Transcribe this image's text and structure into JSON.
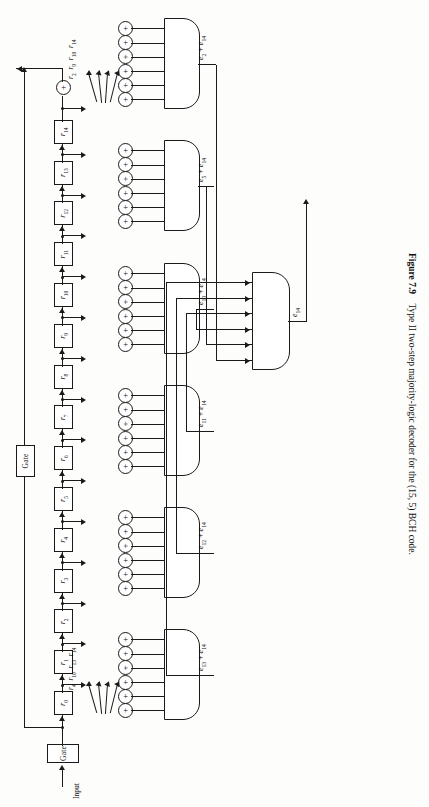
{
  "figure": {
    "number": "Figure 7.9",
    "caption": "Type II two-step majority-logic decoder for the (15, 5) BCH code.",
    "full_caption": "Figure 7.9   Type II two-step majority-logic decoder for the (15, 5) BCH code."
  },
  "input": {
    "label": "Input"
  },
  "gates": {
    "input_gate_label": "Gate",
    "feedback_gate_label": "Gate"
  },
  "shift_register": {
    "stage_labels": [
      "r0",
      "r1",
      "r2",
      "r3",
      "r4",
      "r5",
      "r6",
      "r7",
      "r8",
      "r9",
      "r10",
      "r11",
      "r12",
      "r13",
      "r14"
    ],
    "stage_display": [
      {
        "base": "r",
        "sub": "0"
      },
      {
        "base": "r",
        "sub": "1"
      },
      {
        "base": "r",
        "sub": "2"
      },
      {
        "base": "r",
        "sub": "3"
      },
      {
        "base": "r",
        "sub": "4"
      },
      {
        "base": "r",
        "sub": "5"
      },
      {
        "base": "r",
        "sub": "6"
      },
      {
        "base": "r",
        "sub": "7"
      },
      {
        "base": "r",
        "sub": "8"
      },
      {
        "base": "r",
        "sub": "9"
      },
      {
        "base": "r",
        "sub": "10"
      },
      {
        "base": "r",
        "sub": "11"
      },
      {
        "base": "r",
        "sub": "12"
      },
      {
        "base": "r",
        "sub": "13"
      },
      {
        "base": "r",
        "sub": "14"
      }
    ],
    "stage_count": 15
  },
  "adder_symbol": "+",
  "majority_gates": [
    {
      "id": "mg-e2",
      "output_label": "e2 + e14",
      "output_parts": {
        "first_base": "e",
        "first_sub": "2",
        "second_base": "e",
        "second_sub": "14"
      },
      "adder_count": 6,
      "feed_labels": [
        "r2",
        "r9",
        "r10",
        "r14"
      ]
    },
    {
      "id": "mg-e5",
      "output_label": "e5 + e14",
      "output_parts": {
        "first_base": "e",
        "first_sub": "5",
        "second_base": "e",
        "second_sub": "14"
      },
      "adder_count": 6,
      "feed_labels": []
    },
    {
      "id": "mg-e10",
      "output_label": "e10 + e14",
      "output_parts": {
        "first_base": "e",
        "first_sub": "10",
        "second_base": "e",
        "second_sub": "14"
      },
      "adder_count": 6,
      "feed_labels": []
    },
    {
      "id": "mg-e11",
      "output_label": "e11 + e14",
      "output_parts": {
        "first_base": "e",
        "first_sub": "11",
        "second_base": "e",
        "second_sub": "14"
      },
      "adder_count": 6,
      "feed_labels": []
    },
    {
      "id": "mg-e12",
      "output_label": "e12 + e14",
      "output_parts": {
        "first_base": "e",
        "first_sub": "12",
        "second_base": "e",
        "second_sub": "14"
      },
      "adder_count": 6,
      "feed_labels": []
    },
    {
      "id": "mg-e13",
      "output_label": "e13 + e14",
      "output_parts": {
        "first_base": "e",
        "first_sub": "13",
        "second_base": "e",
        "second_sub": "14"
      },
      "adder_count": 6,
      "feed_labels": [
        "r4",
        "r10",
        "r13",
        "r14"
      ]
    }
  ],
  "final_gate": {
    "id": "mg-final",
    "output_label": "e14",
    "output_parts": {
      "base": "e",
      "sub": "14"
    },
    "input_count": 6
  },
  "feed_groups": {
    "bottom": {
      "labels": [
        "r2",
        "r9",
        "r10",
        "r14"
      ],
      "display": "r2 r9 r10 r14"
    },
    "top": {
      "labels": [
        "r4",
        "r10",
        "r13",
        "r14"
      ],
      "display": "r4 r10 r13 r14"
    }
  },
  "colors": {
    "ink": "#1a1a1a",
    "paper": "#fdfdfc"
  }
}
